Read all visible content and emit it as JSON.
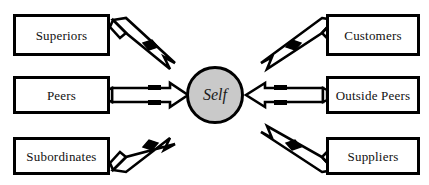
{
  "diagram": {
    "type": "radial-feedback-diagram",
    "center": {
      "label": "Self",
      "shape": "circle",
      "fill": "#c9c9c9",
      "stroke": "#000000",
      "cx": 215,
      "cy": 95,
      "r": 29
    },
    "style": {
      "box_fill": "#ffffff",
      "box_stroke": "#000000",
      "arrow_fill": "#ffffff",
      "arrow_stroke": "#000000",
      "background": "#ffffff"
    },
    "nodes": [
      {
        "id": "superiors",
        "label": "Superiors",
        "side": "left",
        "row": "top",
        "x": 13,
        "y": 14,
        "width": 97,
        "height": 42,
        "arrow_direction": "to-center",
        "arrow_angle": "diagonal-down-right"
      },
      {
        "id": "peers",
        "label": "Peers",
        "side": "left",
        "row": "middle",
        "x": 13,
        "y": 76,
        "width": 97,
        "height": 38,
        "arrow_direction": "to-center",
        "arrow_angle": "horizontal-right"
      },
      {
        "id": "subordinates",
        "label": "Subordinates",
        "side": "left",
        "row": "bottom",
        "x": 13,
        "y": 137,
        "width": 97,
        "height": 38,
        "arrow_direction": "to-center",
        "arrow_angle": "diagonal-up-right"
      },
      {
        "id": "customers",
        "label": "Customers",
        "side": "right",
        "row": "top",
        "x": 326,
        "y": 14,
        "width": 94,
        "height": 42,
        "arrow_direction": "to-center",
        "arrow_angle": "diagonal-down-left"
      },
      {
        "id": "outside-peers",
        "label": "Outside Peers",
        "side": "right",
        "row": "middle",
        "x": 326,
        "y": 76,
        "width": 94,
        "height": 38,
        "arrow_direction": "to-center",
        "arrow_angle": "horizontal-left"
      },
      {
        "id": "suppliers",
        "label": "Suppliers",
        "side": "right",
        "row": "bottom",
        "x": 326,
        "y": 137,
        "width": 94,
        "height": 38,
        "arrow_direction": "to-center",
        "arrow_angle": "diagonal-up-left"
      }
    ],
    "connectors": [
      {
        "id": "arrow-superiors-to-self",
        "from": "superiors",
        "to": "center"
      },
      {
        "id": "arrow-peers-to-self",
        "from": "peers",
        "to": "center"
      },
      {
        "id": "arrow-subordinates-to-self",
        "from": "subordinates",
        "to": "center"
      },
      {
        "id": "arrow-customers-to-self",
        "from": "customers",
        "to": "center"
      },
      {
        "id": "arrow-outside-peers-to-self",
        "from": "outside-peers",
        "to": "center"
      },
      {
        "id": "arrow-suppliers-to-self",
        "from": "suppliers",
        "to": "center"
      }
    ]
  }
}
